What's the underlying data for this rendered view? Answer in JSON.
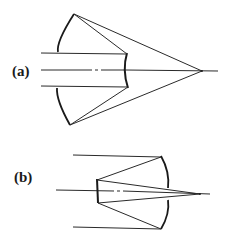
{
  "diagram": {
    "type": "optical-ray-diagram",
    "colors": {
      "line": "#2a2a2a",
      "mirror": "#1a1a1a",
      "background": "#ffffff"
    },
    "panels": [
      {
        "label": "(a)",
        "description": "Incoming beam reflects off a small convex secondary, diverges to a large concave primary, then converges to a focus on the axis",
        "components": [
          "incoming-beam",
          "convex-secondary-mirror",
          "concave-primary-mirror",
          "focal-point",
          "optical-axis"
        ]
      },
      {
        "label": "(b)",
        "description": "Incoming beam reflects off a concave primary toward a small flat secondary, then converges to a focus on the axis",
        "components": [
          "incoming-beam",
          "concave-primary-mirror",
          "flat-secondary-mirror",
          "focal-point",
          "optical-axis"
        ]
      }
    ]
  }
}
